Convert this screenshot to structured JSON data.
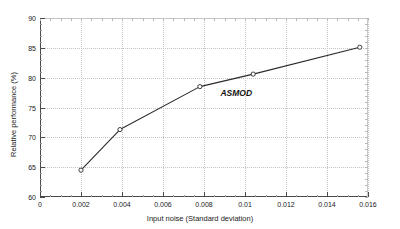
{
  "chart_data": {
    "type": "line",
    "title": "",
    "subtitle": "",
    "xlabel": "Input noise (Standard deviation)",
    "ylabel": "Relative performance (%)",
    "xlim": [
      0,
      0.016
    ],
    "ylim": [
      60,
      90
    ],
    "xticks": [
      0,
      0.002,
      0.004,
      0.006,
      0.008,
      0.01,
      0.012,
      0.014,
      0.016
    ],
    "xticklabels": [
      "0",
      "0.002",
      "0.004",
      "0.006",
      "0.008",
      "0.01",
      "0.012",
      "0.014",
      "0.016"
    ],
    "yticks": [
      60,
      65,
      70,
      75,
      80,
      85,
      90
    ],
    "yticklabels": [
      "60",
      "65",
      "70",
      "75",
      "80",
      "85",
      "90"
    ],
    "grid": true,
    "grid_style": "dotted",
    "legend": null,
    "legend_position": "none",
    "marker": "circle-open",
    "line_color": "#2b2b2b",
    "grid_color": "#c4c4c4",
    "axis_color": "#4a4a4a",
    "background_color": "#ffffff",
    "series": [
      {
        "name": "ASMOD",
        "x": [
          0.002,
          0.0039,
          0.0078,
          0.0104,
          0.0156
        ],
        "y": [
          64.5,
          71.3,
          78.5,
          80.6,
          85.1
        ]
      }
    ],
    "annotations": [
      {
        "text": "ASMOD",
        "x": 0.0088,
        "y": 77.3,
        "style": "bold-italic"
      }
    ]
  }
}
